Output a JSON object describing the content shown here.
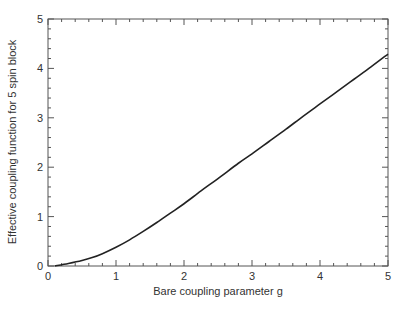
{
  "chart_data": {
    "type": "line",
    "title": "",
    "xlabel": "Bare coupling parameter g",
    "ylabel": "Effective coupling function for 5 spin block",
    "xlim": [
      0,
      5
    ],
    "ylim": [
      0,
      5
    ],
    "xticks": [
      0,
      1,
      2,
      3,
      4,
      5
    ],
    "yticks": [
      0,
      1,
      2,
      3,
      4,
      5
    ],
    "x_minor_step": 0.2,
    "y_minor_step": 0.2,
    "grid": false,
    "legend": null,
    "series": [
      {
        "name": "effective coupling",
        "color": "#222222",
        "x": [
          0.1,
          0.3,
          0.5,
          0.65,
          0.8,
          1.0,
          1.2,
          1.4,
          1.6,
          1.8,
          2.0,
          2.25,
          2.5,
          2.8,
          3.0,
          3.25,
          3.5,
          3.75,
          4.0,
          4.25,
          4.5,
          4.75,
          5.0
        ],
        "values": [
          0.0,
          0.05,
          0.11,
          0.17,
          0.25,
          0.38,
          0.53,
          0.7,
          0.88,
          1.07,
          1.26,
          1.52,
          1.77,
          2.08,
          2.27,
          2.52,
          2.77,
          3.03,
          3.28,
          3.53,
          3.78,
          4.03,
          4.29
        ]
      }
    ]
  }
}
